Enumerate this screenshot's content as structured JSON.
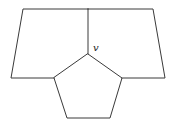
{
  "diagram": {
    "type": "planar-graph-faces",
    "colors": {
      "stroke": "#3a3a3a",
      "background": "#ffffff",
      "label": "#222222"
    },
    "vertex_label": "v",
    "vertices": {
      "top_left": [
        23,
        9
      ],
      "top_mid": [
        88,
        9
      ],
      "top_right": [
        153,
        9
      ],
      "bottom_left": [
        11,
        78
      ],
      "bottom_right": [
        165,
        78
      ],
      "v": [
        88,
        54
      ],
      "pent_left": [
        54,
        78
      ],
      "pent_right": [
        122,
        78
      ],
      "pent_bottom_left": [
        67,
        118
      ],
      "pent_bottom_right": [
        110,
        118
      ]
    },
    "faces": [
      {
        "name": "left-quadrilateral",
        "vertices": [
          "top_left",
          "top_mid",
          "v",
          "pent_left",
          "bottom_left"
        ]
      },
      {
        "name": "right-quadrilateral",
        "vertices": [
          "top_mid",
          "top_right",
          "bottom_right",
          "pent_right",
          "v"
        ]
      },
      {
        "name": "pentagon",
        "vertices": [
          "v",
          "pent_right",
          "pent_bottom_right",
          "pent_bottom_left",
          "pent_left"
        ]
      }
    ]
  }
}
